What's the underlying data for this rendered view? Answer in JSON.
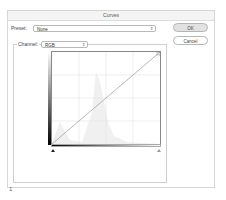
{
  "dialog": {
    "title": "Curves",
    "preset": {
      "label": "Preset:",
      "value": "None"
    },
    "channel": {
      "label": "Channel:",
      "value": "RGB"
    },
    "buttons": {
      "ok": "OK",
      "cancel": "Cancel"
    },
    "graph": {
      "curve": "identity diagonal",
      "grid_divisions": 4,
      "input_black_slider": "black-point-triangle",
      "input_white_slider": "white-point-triangle"
    }
  },
  "footer": {
    "page_number": "1"
  },
  "icons": {
    "stepper": "⇕"
  }
}
